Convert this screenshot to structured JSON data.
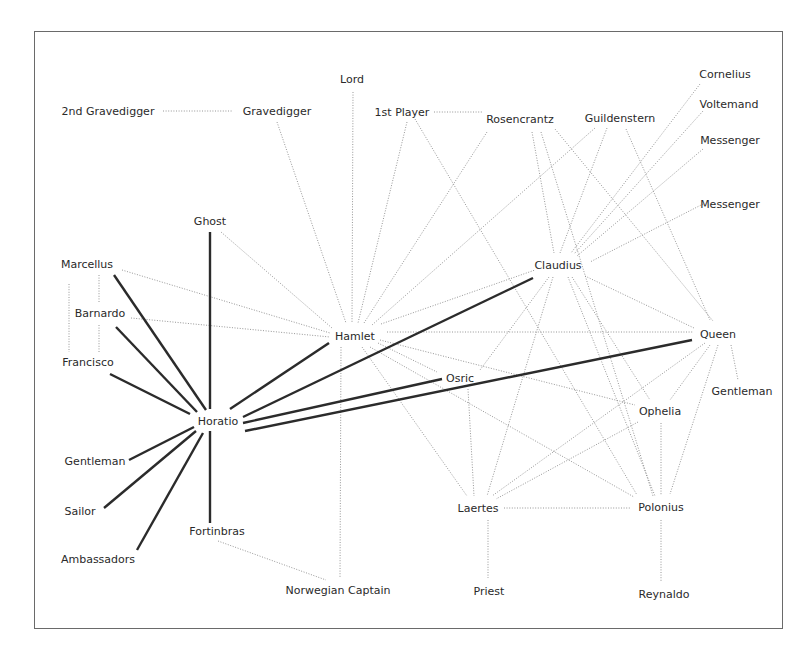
{
  "diagram": {
    "type": "network",
    "title": "",
    "legend": {
      "strong_edge_color": "#2b2b2b",
      "weak_edge_color": "#8a8a8a"
    },
    "nodes": [
      {
        "id": "gravedigger2",
        "label": "2nd Gravedigger",
        "x": 108,
        "y": 111
      },
      {
        "id": "gravedigger",
        "label": "Gravedigger",
        "x": 277,
        "y": 111
      },
      {
        "id": "lord",
        "label": "Lord",
        "x": 352,
        "y": 79
      },
      {
        "id": "player1",
        "label": "1st Player",
        "x": 402,
        "y": 112
      },
      {
        "id": "rosencrantz",
        "label": "Rosencrantz",
        "x": 520,
        "y": 119
      },
      {
        "id": "guildenstern",
        "label": "Guildenstern",
        "x": 620,
        "y": 118
      },
      {
        "id": "cornelius",
        "label": "Cornelius",
        "x": 725,
        "y": 74
      },
      {
        "id": "voltemand",
        "label": "Voltemand",
        "x": 729,
        "y": 104
      },
      {
        "id": "messenger1",
        "label": "Messenger",
        "x": 730,
        "y": 140
      },
      {
        "id": "messenger2",
        "label": "Messenger",
        "x": 730,
        "y": 204
      },
      {
        "id": "ghost",
        "label": "Ghost",
        "x": 210,
        "y": 221
      },
      {
        "id": "marcellus",
        "label": "Marcellus",
        "x": 87,
        "y": 264
      },
      {
        "id": "barnardo",
        "label": "Barnardo",
        "x": 100,
        "y": 313
      },
      {
        "id": "francisco",
        "label": "Francisco",
        "x": 88,
        "y": 362
      },
      {
        "id": "hamlet",
        "label": "Hamlet",
        "x": 355,
        "y": 336
      },
      {
        "id": "claudius",
        "label": "Claudius",
        "x": 558,
        "y": 265
      },
      {
        "id": "queen",
        "label": "Queen",
        "x": 718,
        "y": 334
      },
      {
        "id": "osric",
        "label": "Osric",
        "x": 460,
        "y": 378
      },
      {
        "id": "horatio",
        "label": "Horatio",
        "x": 218,
        "y": 421
      },
      {
        "id": "gentleman_l",
        "label": "Gentleman",
        "x": 95,
        "y": 461
      },
      {
        "id": "sailor",
        "label": "Sailor",
        "x": 80,
        "y": 511
      },
      {
        "id": "ambassadors",
        "label": "Ambassadors",
        "x": 98,
        "y": 559
      },
      {
        "id": "fortinbras",
        "label": "Fortinbras",
        "x": 217,
        "y": 531
      },
      {
        "id": "ophelia",
        "label": "Ophelia",
        "x": 660,
        "y": 411
      },
      {
        "id": "gentleman_r",
        "label": "Gentleman",
        "x": 742,
        "y": 391
      },
      {
        "id": "laertes",
        "label": "Laertes",
        "x": 478,
        "y": 508
      },
      {
        "id": "polonius",
        "label": "Polonius",
        "x": 661,
        "y": 507
      },
      {
        "id": "norwegian_captain",
        "label": "Norwegian Captain",
        "x": 338,
        "y": 590
      },
      {
        "id": "priest",
        "label": "Priest",
        "x": 489,
        "y": 591
      },
      {
        "id": "reynaldo",
        "label": "Reynaldo",
        "x": 664,
        "y": 594
      }
    ],
    "edges_strong": [
      {
        "from": "horatio",
        "to": "ghost",
        "pts": [
          210,
          232,
          210,
          409
        ]
      },
      {
        "from": "horatio",
        "to": "marcellus",
        "pts": [
          114,
          275,
          206,
          410
        ]
      },
      {
        "from": "horatio",
        "to": "barnardo",
        "pts": [
          116,
          327,
          197,
          412
        ]
      },
      {
        "from": "horatio",
        "to": "francisco",
        "pts": [
          110,
          374,
          190,
          414
        ]
      },
      {
        "from": "horatio",
        "to": "hamlet",
        "pts": [
          230,
          409,
          329,
          343
        ]
      },
      {
        "from": "horatio",
        "to": "claudius",
        "pts": [
          243,
          417,
          533,
          278
        ]
      },
      {
        "from": "horatio",
        "to": "osric",
        "pts": [
          243,
          423,
          442,
          379
        ]
      },
      {
        "from": "horatio",
        "to": "queen",
        "pts": [
          245,
          431,
          692,
          340
        ]
      },
      {
        "from": "horatio",
        "to": "gentleman_l",
        "pts": [
          129,
          460,
          194,
          427
        ]
      },
      {
        "from": "horatio",
        "to": "sailor",
        "pts": [
          104,
          508,
          196,
          431
        ]
      },
      {
        "from": "horatio",
        "to": "ambassadors",
        "pts": [
          137,
          550,
          203,
          433
        ]
      },
      {
        "from": "horatio",
        "to": "fortinbras",
        "pts": [
          210,
          431,
          210,
          523
        ]
      }
    ],
    "edges_weak": [
      {
        "from": "gravedigger2",
        "to": "gravedigger",
        "pts": [
          163,
          111,
          232,
          111
        ]
      },
      {
        "from": "gravedigger",
        "to": "hamlet",
        "pts": [
          277,
          122,
          346,
          323
        ]
      },
      {
        "from": "lord",
        "to": "hamlet",
        "pts": [
          353,
          92,
          352,
          323
        ]
      },
      {
        "from": "player1",
        "to": "rosencrantz",
        "pts": [
          434,
          112,
          482,
          112
        ]
      },
      {
        "from": "player1",
        "to": "hamlet",
        "pts": [
          407,
          122,
          358,
          323
        ]
      },
      {
        "from": "player1",
        "to": "polonius",
        "pts": [
          415,
          119,
          637,
          495
        ]
      },
      {
        "from": "rosencrantz",
        "to": "hamlet",
        "pts": [
          487,
          132,
          364,
          323
        ]
      },
      {
        "from": "rosencrantz",
        "to": "claudius",
        "pts": [
          532,
          132,
          554,
          253
        ]
      },
      {
        "from": "rosencrantz",
        "to": "polonius",
        "pts": [
          541,
          132,
          653,
          496
        ]
      },
      {
        "from": "rosencrantz",
        "to": "queen",
        "pts": [
          555,
          129,
          713,
          321
        ]
      },
      {
        "from": "guildenstern",
        "to": "hamlet",
        "pts": [
          595,
          128,
          372,
          325
        ]
      },
      {
        "from": "guildenstern",
        "to": "claudius",
        "pts": [
          607,
          128,
          560,
          253
        ]
      },
      {
        "from": "guildenstern",
        "to": "queen",
        "pts": [
          626,
          129,
          710,
          320
        ]
      },
      {
        "from": "cornelius",
        "to": "claudius",
        "pts": [
          700,
          84,
          571,
          253
        ]
      },
      {
        "from": "voltemand",
        "to": "claudius",
        "pts": [
          703,
          111,
          574,
          254
        ]
      },
      {
        "from": "messenger1",
        "to": "claudius",
        "pts": [
          703,
          149,
          577,
          256
        ]
      },
      {
        "from": "messenger2",
        "to": "claudius",
        "pts": [
          703,
          204,
          590,
          262
        ]
      },
      {
        "from": "ghost",
        "to": "hamlet",
        "pts": [
          221,
          232,
          332,
          328
        ]
      },
      {
        "from": "marcellus",
        "to": "hamlet",
        "pts": [
          122,
          270,
          330,
          333
        ]
      },
      {
        "from": "barnardo",
        "to": "hamlet",
        "pts": [
          131,
          318,
          330,
          337
        ]
      },
      {
        "from": "marcellus",
        "to": "barnardo",
        "pts": [
          99,
          275,
          99,
          302
        ]
      },
      {
        "from": "barnardo",
        "to": "francisco",
        "pts": [
          99,
          325,
          99,
          352
        ]
      },
      {
        "from": "marcellus",
        "to": "francisco",
        "pts": [
          69,
          284,
          69,
          352
        ]
      },
      {
        "from": "hamlet",
        "to": "claudius",
        "pts": [
          381,
          324,
          535,
          270
        ]
      },
      {
        "from": "hamlet",
        "to": "queen",
        "pts": [
          387,
          332,
          693,
          332
        ]
      },
      {
        "from": "hamlet",
        "to": "osric",
        "pts": [
          378,
          343,
          437,
          372
        ]
      },
      {
        "from": "hamlet",
        "to": "ophelia",
        "pts": [
          380,
          340,
          635,
          405
        ]
      },
      {
        "from": "hamlet",
        "to": "polonius",
        "pts": [
          370,
          347,
          634,
          497
        ]
      },
      {
        "from": "hamlet",
        "to": "laertes",
        "pts": [
          362,
          347,
          467,
          496
        ]
      },
      {
        "from": "hamlet",
        "to": "norwegian_captain",
        "pts": [
          341,
          347,
          340,
          578
        ]
      },
      {
        "from": "fortinbras",
        "to": "norwegian_captain",
        "pts": [
          218,
          541,
          326,
          580
        ]
      },
      {
        "from": "claudius",
        "to": "osric",
        "pts": [
          549,
          277,
          480,
          370
        ]
      },
      {
        "from": "claudius",
        "to": "laertes",
        "pts": [
          553,
          277,
          487,
          496
        ]
      },
      {
        "from": "claudius",
        "to": "queen",
        "pts": [
          585,
          276,
          694,
          328
        ]
      },
      {
        "from": "claudius",
        "to": "polonius",
        "pts": [
          568,
          277,
          655,
          496
        ]
      },
      {
        "from": "claudius",
        "to": "ophelia",
        "pts": [
          572,
          277,
          650,
          400
        ]
      },
      {
        "from": "claudius",
        "to": "gentleman_r_dummy",
        "pts": [
          0,
          0,
          0,
          0
        ]
      },
      {
        "from": "queen",
        "to": "ophelia",
        "pts": [
          710,
          345,
          670,
          400
        ]
      },
      {
        "from": "queen",
        "to": "laertes",
        "pts": [
          705,
          343,
          492,
          496
        ]
      },
      {
        "from": "queen",
        "to": "polonius",
        "pts": [
          718,
          345,
          670,
          494
        ]
      },
      {
        "from": "queen",
        "to": "gentleman_r",
        "pts": [
          731,
          345,
          738,
          380
        ]
      },
      {
        "from": "osric",
        "to": "laertes",
        "pts": [
          468,
          389,
          474,
          496
        ]
      },
      {
        "from": "ophelia",
        "to": "laertes",
        "pts": [
          638,
          422,
          496,
          499
        ]
      },
      {
        "from": "ophelia",
        "to": "polonius",
        "pts": [
          661,
          423,
          661,
          495
        ]
      },
      {
        "from": "laertes",
        "to": "polonius",
        "pts": [
          504,
          508,
          630,
          508
        ]
      },
      {
        "from": "laertes",
        "to": "priest",
        "pts": [
          488,
          520,
          488,
          578
        ]
      },
      {
        "from": "polonius",
        "to": "reynaldo",
        "pts": [
          661,
          520,
          661,
          582
        ]
      }
    ]
  }
}
